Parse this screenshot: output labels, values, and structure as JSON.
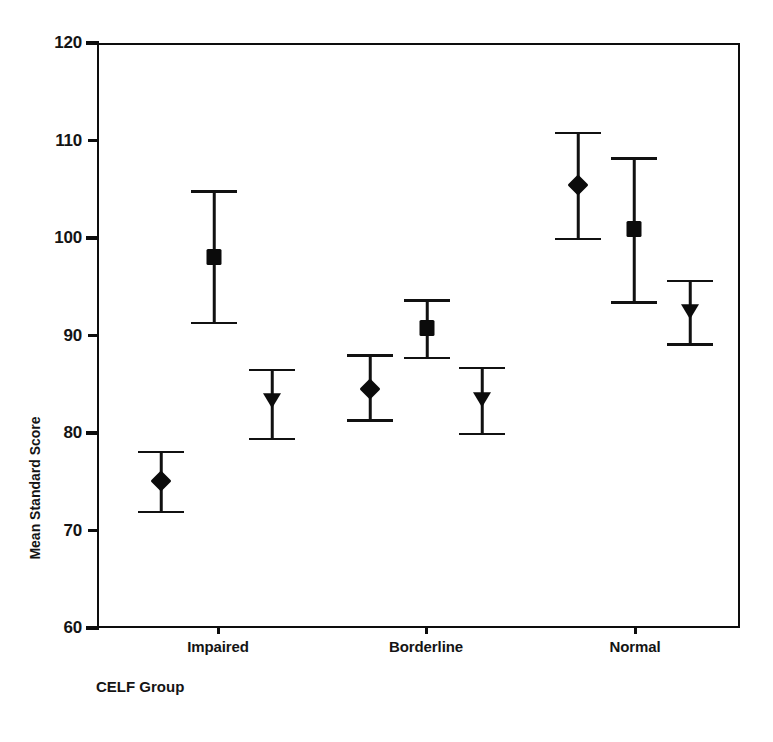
{
  "chart_data": {
    "type": "scatter",
    "title": "",
    "xlabel": "CELF Group",
    "ylabel": "Mean Standard Score",
    "ylim": [
      60,
      120
    ],
    "yticks": [
      60,
      70,
      80,
      90,
      100,
      110,
      120
    ],
    "ytick_labels": [
      "60",
      "70",
      "80",
      "90",
      "100",
      "110",
      "120"
    ],
    "grid": false,
    "legend": "none",
    "categories": [
      "Impaired",
      "Borderline",
      "Normal"
    ],
    "error_type": "95% confidence interval",
    "series": [
      {
        "name": "Series 1",
        "marker": "diamond",
        "values": [
          75.1,
          84.5,
          105.4
        ],
        "ci_lower": [
          71.9,
          81.3,
          99.9
        ],
        "ci_upper": [
          78.1,
          88.0,
          110.8
        ]
      },
      {
        "name": "Series 2",
        "marker": "square",
        "values": [
          98.0,
          90.8,
          100.9
        ],
        "ci_lower": [
          91.3,
          87.7,
          93.4
        ],
        "ci_upper": [
          104.8,
          93.6,
          108.2
        ]
      },
      {
        "name": "Series 3",
        "marker": "triangle-down",
        "values": [
          83.3,
          83.4,
          92.4
        ],
        "ci_lower": [
          79.4,
          79.9,
          89.1
        ],
        "ci_upper": [
          86.5,
          86.7,
          95.6
        ]
      }
    ],
    "points": [
      {
        "group": "Impaired",
        "series": "Series 1",
        "marker": "diamond",
        "x_px": 161,
        "value": 75.1,
        "ci_lower": 71.9,
        "ci_upper": 78.1
      },
      {
        "group": "Impaired",
        "series": "Series 2",
        "marker": "square",
        "x_px": 214,
        "value": 98.0,
        "ci_lower": 91.3,
        "ci_upper": 104.8
      },
      {
        "group": "Impaired",
        "series": "Series 3",
        "marker": "triangle-down",
        "x_px": 272,
        "value": 83.3,
        "ci_lower": 79.4,
        "ci_upper": 86.5
      },
      {
        "group": "Borderline",
        "series": "Series 1",
        "marker": "diamond",
        "x_px": 370,
        "value": 84.5,
        "ci_lower": 81.3,
        "ci_upper": 88.0
      },
      {
        "group": "Borderline",
        "series": "Series 2",
        "marker": "square",
        "x_px": 427,
        "value": 90.8,
        "ci_lower": 87.7,
        "ci_upper": 93.6
      },
      {
        "group": "Borderline",
        "series": "Series 3",
        "marker": "triangle-down",
        "x_px": 482,
        "value": 83.4,
        "ci_lower": 79.9,
        "ci_upper": 86.7
      },
      {
        "group": "Normal",
        "series": "Series 1",
        "marker": "diamond",
        "x_px": 578,
        "value": 105.4,
        "ci_lower": 99.9,
        "ci_upper": 110.8
      },
      {
        "group": "Normal",
        "series": "Series 2",
        "marker": "square",
        "x_px": 634,
        "value": 100.9,
        "ci_lower": 93.4,
        "ci_upper": 108.2
      },
      {
        "group": "Normal",
        "series": "Series 3",
        "marker": "triangle-down",
        "x_px": 690,
        "value": 92.4,
        "ci_lower": 89.1,
        "ci_upper": 95.6
      }
    ],
    "category_tick_px": [
      218,
      426,
      635
    ],
    "colors": {
      "axis": "#0d0d0d",
      "marker": "#0b0b0b",
      "text": "#141414",
      "background": "#ffffff"
    }
  }
}
